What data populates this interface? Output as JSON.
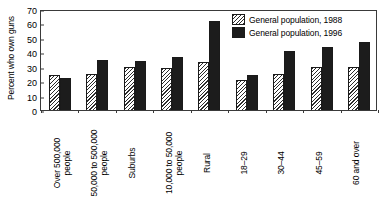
{
  "chart_data": {
    "type": "bar",
    "title": "",
    "subtitle": "",
    "xlabel": "",
    "ylabel": "Percent who own guns",
    "ylim": [
      0,
      70
    ],
    "ytick_step": 10,
    "yticks": [
      0,
      10,
      20,
      30,
      40,
      50,
      60,
      70
    ],
    "grid": false,
    "legend_position": "top-right",
    "categories": [
      "Over 500,000 people",
      "50,000 to 500,000 people",
      "Suburbs",
      "10,000 to 50,000 people",
      "Rural",
      "18–29",
      "30–44",
      "45–59",
      "60 and over"
    ],
    "category_lines": [
      [
        "Over 500,000",
        "people"
      ],
      [
        "50,000 to 500,000",
        "people"
      ],
      [
        "Suburbs",
        ""
      ],
      [
        "10,000 to 50,000",
        "people"
      ],
      [
        "Rural",
        ""
      ],
      [
        "18–29",
        ""
      ],
      [
        "30–44",
        ""
      ],
      [
        "45–59",
        ""
      ],
      [
        "60 and over",
        ""
      ]
    ],
    "series": [
      {
        "name": "General population, 1988",
        "fill": "hatched-diagonal",
        "color": "#ffffff",
        "values": [
          24,
          25,
          30,
          29,
          33,
          21,
          25,
          30,
          30
        ]
      },
      {
        "name": "General population, 1996",
        "fill": "solid-black",
        "color": "#1c1c1c",
        "values": [
          22,
          35,
          34,
          37,
          62,
          24,
          41,
          44,
          47
        ]
      }
    ]
  },
  "legend": {
    "items": [
      {
        "label": "General population, 1988"
      },
      {
        "label": "General population, 1996"
      }
    ]
  }
}
